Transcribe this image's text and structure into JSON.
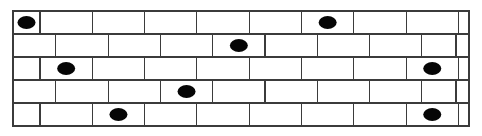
{
  "figure": {
    "background_color": "#ffffff",
    "brick_fill": "#ffffff",
    "brick_stroke": "#3b3b3b",
    "marker_color": "#060606",
    "marker_shape": "ellipse"
  },
  "geometry": {
    "wall_left": 13,
    "wall_top": 11,
    "wall_right": 469,
    "wall_bottom": 126,
    "row_count": 5,
    "row_height": 23,
    "brick_width": 52.3,
    "marker_rx": 9,
    "marker_ry": 6.5
  },
  "chart_data": {
    "type": "diagram",
    "rows": [
      {
        "index": 1,
        "y_top": 11,
        "y_bottom": 34,
        "offset": "half",
        "bricks": [
          {
            "x0": 13,
            "x1": 40,
            "marked": true
          },
          {
            "x0": 40,
            "x1": 92.3,
            "marked": false
          },
          {
            "x0": 92.3,
            "x1": 144.6,
            "marked": false
          },
          {
            "x0": 144.6,
            "x1": 196.9,
            "marked": false
          },
          {
            "x0": 196.9,
            "x1": 249.2,
            "marked": false
          },
          {
            "x0": 249.2,
            "x1": 301.5,
            "marked": false
          },
          {
            "x0": 301.5,
            "x1": 353.8,
            "marked": true
          },
          {
            "x0": 353.8,
            "x1": 406.1,
            "marked": false
          },
          {
            "x0": 406.1,
            "x1": 458.4,
            "marked": false
          },
          {
            "x0": 458.4,
            "x1": 469,
            "marked": false
          }
        ]
      },
      {
        "index": 2,
        "y_top": 34,
        "y_bottom": 57,
        "offset": "full",
        "bricks": [
          {
            "x0": 13,
            "x1": 55.8,
            "marked": false
          },
          {
            "x0": 55.8,
            "x1": 108.1,
            "marked": false
          },
          {
            "x0": 108.1,
            "x1": 160.4,
            "marked": false
          },
          {
            "x0": 160.4,
            "x1": 212.7,
            "marked": false
          },
          {
            "x0": 212.7,
            "x1": 265.0,
            "marked": true
          },
          {
            "x0": 265.0,
            "x1": 317.3,
            "marked": false
          },
          {
            "x0": 317.3,
            "x1": 369.6,
            "marked": false
          },
          {
            "x0": 369.6,
            "x1": 421.9,
            "marked": false
          },
          {
            "x0": 421.9,
            "x1": 456.0,
            "marked": false
          },
          {
            "x0": 456.0,
            "x1": 469,
            "marked": false
          }
        ]
      },
      {
        "index": 3,
        "y_top": 57,
        "y_bottom": 80,
        "offset": "half",
        "bricks": [
          {
            "x0": 13,
            "x1": 40,
            "marked": false
          },
          {
            "x0": 40,
            "x1": 92.3,
            "marked": true
          },
          {
            "x0": 92.3,
            "x1": 144.6,
            "marked": false
          },
          {
            "x0": 144.6,
            "x1": 196.9,
            "marked": false
          },
          {
            "x0": 196.9,
            "x1": 249.2,
            "marked": false
          },
          {
            "x0": 249.2,
            "x1": 301.5,
            "marked": false
          },
          {
            "x0": 301.5,
            "x1": 353.8,
            "marked": false
          },
          {
            "x0": 353.8,
            "x1": 406.1,
            "marked": false
          },
          {
            "x0": 406.1,
            "x1": 458.4,
            "marked": true
          },
          {
            "x0": 458.4,
            "x1": 469,
            "marked": false
          }
        ]
      },
      {
        "index": 4,
        "y_top": 80,
        "y_bottom": 103,
        "offset": "full",
        "bricks": [
          {
            "x0": 13,
            "x1": 55.8,
            "marked": false
          },
          {
            "x0": 55.8,
            "x1": 108.1,
            "marked": false
          },
          {
            "x0": 108.1,
            "x1": 160.4,
            "marked": false
          },
          {
            "x0": 160.4,
            "x1": 212.7,
            "marked": true
          },
          {
            "x0": 212.7,
            "x1": 265.0,
            "marked": false
          },
          {
            "x0": 265.0,
            "x1": 317.3,
            "marked": false
          },
          {
            "x0": 317.3,
            "x1": 369.6,
            "marked": false
          },
          {
            "x0": 369.6,
            "x1": 421.9,
            "marked": false
          },
          {
            "x0": 421.9,
            "x1": 456.0,
            "marked": false
          },
          {
            "x0": 456.0,
            "x1": 469,
            "marked": false
          }
        ]
      },
      {
        "index": 5,
        "y_top": 103,
        "y_bottom": 126,
        "offset": "half",
        "bricks": [
          {
            "x0": 13,
            "x1": 40,
            "marked": false
          },
          {
            "x0": 40,
            "x1": 92.3,
            "marked": false
          },
          {
            "x0": 92.3,
            "x1": 144.6,
            "marked": true
          },
          {
            "x0": 144.6,
            "x1": 196.9,
            "marked": false
          },
          {
            "x0": 196.9,
            "x1": 249.2,
            "marked": false
          },
          {
            "x0": 249.2,
            "x1": 301.5,
            "marked": false
          },
          {
            "x0": 301.5,
            "x1": 353.8,
            "marked": false
          },
          {
            "x0": 353.8,
            "x1": 406.1,
            "marked": false
          },
          {
            "x0": 406.1,
            "x1": 458.4,
            "marked": true
          },
          {
            "x0": 458.4,
            "x1": 469,
            "marked": false
          }
        ]
      }
    ],
    "marked_count": 8,
    "total_bricks": 50
  }
}
